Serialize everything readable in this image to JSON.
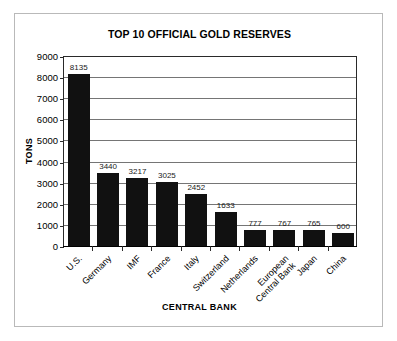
{
  "chart_data": {
    "type": "bar",
    "title": "TOP 10 OFFICIAL GOLD RESERVES",
    "xlabel": "CENTRAL BANK",
    "ylabel": "TONS",
    "categories": [
      "U.S.",
      "Germany",
      "IMF",
      "France",
      "Italy",
      "Switzerland",
      "Netherlands",
      "European\nCentral Bank",
      "Japan",
      "China"
    ],
    "values": [
      8135,
      3440,
      3217,
      3025,
      2452,
      1633,
      777,
      767,
      765,
      600
    ],
    "value_labels": [
      "8135",
      "3440",
      "3217",
      "3025",
      "2452",
      "1633",
      "777",
      "767",
      "765",
      "600"
    ],
    "ylim": [
      0,
      9000
    ],
    "ytick_labels": [
      "0",
      "1000",
      "2000",
      "3000",
      "4000",
      "5000",
      "6000",
      "7000",
      "8000",
      "9000"
    ],
    "ytick_values": [
      0,
      1000,
      2000,
      3000,
      4000,
      5000,
      6000,
      7000,
      8000,
      9000
    ],
    "grid": "horizontal",
    "legend": "none",
    "bar_color": "#111111",
    "grid_color": "#757575",
    "axis_color": "#000000",
    "frame_color": "#b9b9b9"
  }
}
